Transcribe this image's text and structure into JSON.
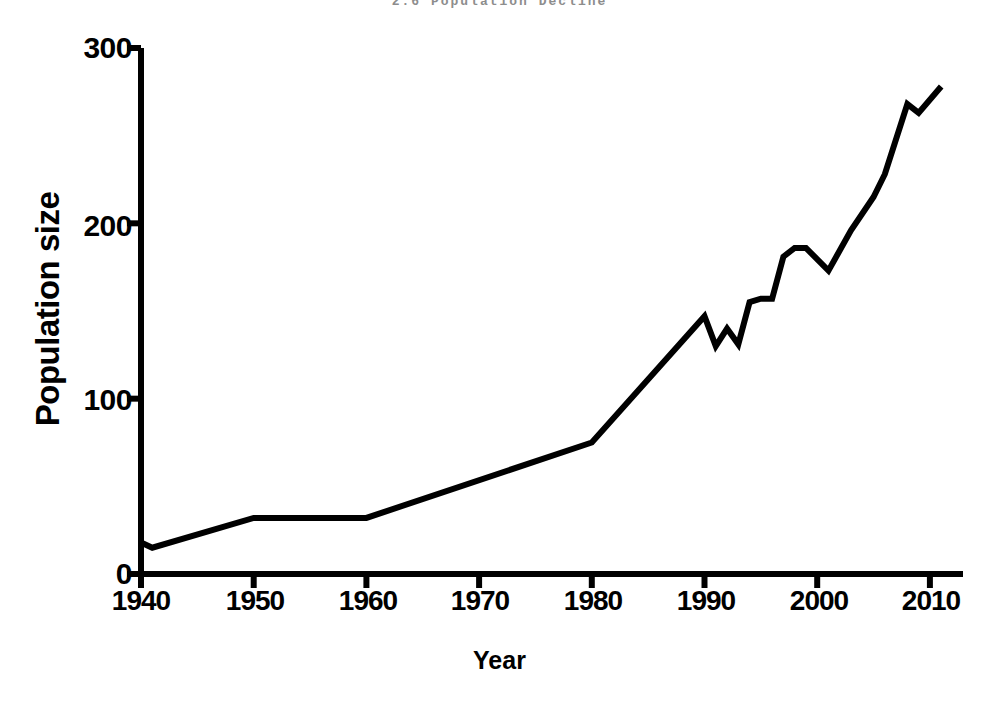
{
  "top_caption": "2.6   Population Decline",
  "axis": {
    "ylabel": "Population size",
    "xlabel": "Year",
    "ytick_labels": [
      "0",
      "100",
      "200",
      "300"
    ],
    "xtick_labels": [
      "1940",
      "1950",
      "1960",
      "1970",
      "1980",
      "1990",
      "2000",
      "2010"
    ]
  },
  "style": {
    "line_color": "#000000",
    "axis_color": "#000000",
    "background": "#ffffff"
  },
  "chart_data": {
    "type": "line",
    "title": "",
    "xlabel": "Year",
    "ylabel": "Population size",
    "xlim": [
      1940,
      2012
    ],
    "ylim": [
      0,
      300
    ],
    "xticks": [
      1940,
      1950,
      1960,
      1970,
      1980,
      1990,
      2000,
      2010
    ],
    "yticks": [
      0,
      100,
      200,
      300
    ],
    "grid": false,
    "legend": "none",
    "series": [
      {
        "name": "Population size",
        "x": [
          1940,
          1941,
          1950,
          1960,
          1980,
          1990,
          1991,
          1992,
          1993,
          1994,
          1995,
          1996,
          1997,
          1998,
          1999,
          2001,
          2003,
          2005,
          2006,
          2008,
          2009,
          2011
        ],
        "y": [
          18,
          15,
          32,
          32,
          75,
          147,
          130,
          140,
          131,
          155,
          157,
          157,
          181,
          186,
          186,
          173,
          196,
          215,
          228,
          268,
          263,
          278
        ]
      }
    ]
  }
}
